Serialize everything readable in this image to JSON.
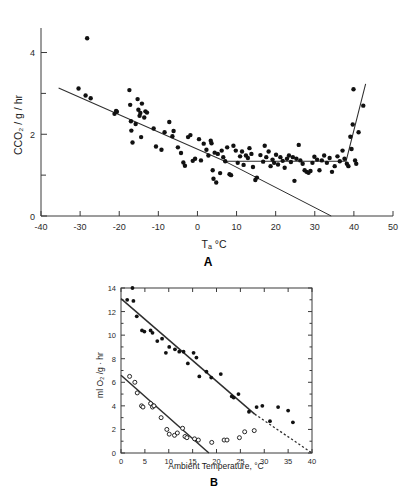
{
  "figure": {
    "background": "#ffffff",
    "ink_color": "#1a1a1a",
    "panel_a_label": "A",
    "panel_b_label": "B"
  },
  "chart_data": [
    {
      "id": "panel-a",
      "type": "scatter",
      "title": "",
      "panel_label": "A",
      "xlabel": "Tₐ °C",
      "ylabel": "CCO₂ / g / hr",
      "xlim": [
        -40,
        50
      ],
      "ylim": [
        0,
        4.6
      ],
      "grid": false,
      "legend": "none",
      "xticks": [
        -40,
        -30,
        -20,
        -10,
        0,
        10,
        20,
        30,
        40,
        50
      ],
      "xticklabels": [
        "-40",
        "-30",
        "-20",
        "-10",
        "0",
        "10",
        "20",
        "30",
        "40",
        "50"
      ],
      "yticks": [
        0,
        1,
        2,
        3,
        4
      ],
      "yticklabels": [
        "0",
        "",
        "2",
        "",
        "4"
      ],
      "y_minor_ticks": [
        1,
        3
      ],
      "series": [
        {
          "name": "CO2 production",
          "marker": "filled-circle",
          "color": "#111111",
          "points": [
            [
              -30.4,
              3.12
            ],
            [
              -28.2,
              4.35
            ],
            [
              -28.6,
              2.95
            ],
            [
              -27.3,
              2.88
            ],
            [
              -21.2,
              2.5
            ],
            [
              -20.8,
              2.57
            ],
            [
              -20.6,
              2.55
            ],
            [
              -17.4,
              3.08
            ],
            [
              -17.2,
              2.72
            ],
            [
              -17.0,
              2.32
            ],
            [
              -16.9,
              2.09
            ],
            [
              -16.6,
              1.8
            ],
            [
              -15.8,
              2.25
            ],
            [
              -15.3,
              2.86
            ],
            [
              -15.1,
              2.6
            ],
            [
              -14.8,
              2.45
            ],
            [
              -14.6,
              2.52
            ],
            [
              -14.4,
              1.93
            ],
            [
              -14.2,
              2.75
            ],
            [
              -13.6,
              2.41
            ],
            [
              -13.3,
              2.56
            ],
            [
              -12.9,
              2.53
            ],
            [
              -11.2,
              2.14
            ],
            [
              -10.6,
              1.7
            ],
            [
              -9.2,
              1.62
            ],
            [
              -8.4,
              2.05
            ],
            [
              -7.2,
              2.3
            ],
            [
              -6.4,
              1.95
            ],
            [
              -6.1,
              2.08
            ],
            [
              -5.0,
              1.68
            ],
            [
              -4.2,
              1.54
            ],
            [
              -3.6,
              1.31
            ],
            [
              -3.2,
              1.23
            ],
            [
              -2.4,
              1.93
            ],
            [
              -1.8,
              1.98
            ],
            [
              -1.2,
              1.35
            ],
            [
              -0.6,
              1.4
            ],
            [
              0.4,
              1.88
            ],
            [
              0.9,
              1.36
            ],
            [
              1.6,
              1.77
            ],
            [
              2.3,
              1.62
            ],
            [
              2.8,
              1.48
            ],
            [
              3.4,
              1.84
            ],
            [
              3.6,
              1.78
            ],
            [
              3.9,
              1.12
            ],
            [
              4.1,
              0.91
            ],
            [
              4.4,
              1.55
            ],
            [
              4.8,
              0.82
            ],
            [
              5.2,
              1.52
            ],
            [
              5.8,
              1.05
            ],
            [
              6.2,
              1.6
            ],
            [
              6.6,
              1.44
            ],
            [
              7.1,
              1.34
            ],
            [
              7.6,
              1.68
            ],
            [
              8.2,
              1.02
            ],
            [
              8.6,
              1.0
            ],
            [
              9.2,
              1.72
            ],
            [
              9.8,
              1.6
            ],
            [
              10.3,
              1.3
            ],
            [
              10.9,
              1.46
            ],
            [
              11.4,
              1.58
            ],
            [
              11.8,
              1.25
            ],
            [
              12.4,
              1.48
            ],
            [
              12.9,
              1.42
            ],
            [
              13.3,
              1.66
            ],
            [
              13.8,
              1.52
            ],
            [
              14.2,
              1.2
            ],
            [
              14.8,
              0.88
            ],
            [
              15.2,
              0.94
            ],
            [
              16.1,
              1.49
            ],
            [
              16.8,
              1.33
            ],
            [
              17.2,
              1.72
            ],
            [
              17.6,
              1.44
            ],
            [
              18.2,
              1.58
            ],
            [
              18.7,
              1.22
            ],
            [
              19.2,
              1.38
            ],
            [
              19.6,
              1.3
            ],
            [
              20.1,
              1.5
            ],
            [
              20.6,
              1.26
            ],
            [
              21.2,
              1.44
            ],
            [
              21.8,
              1.35
            ],
            [
              22.3,
              1.18
            ],
            [
              22.9,
              1.4
            ],
            [
              23.4,
              1.48
            ],
            [
              23.9,
              1.32
            ],
            [
              24.4,
              1.44
            ],
            [
              24.8,
              0.86
            ],
            [
              25.3,
              1.4
            ],
            [
              25.9,
              1.74
            ],
            [
              26.3,
              1.36
            ],
            [
              26.9,
              1.28
            ],
            [
              27.4,
              1.12
            ],
            [
              27.9,
              1.08
            ],
            [
              28.4,
              1.06
            ],
            [
              28.9,
              1.1
            ],
            [
              29.4,
              1.3
            ],
            [
              29.9,
              1.45
            ],
            [
              30.6,
              1.38
            ],
            [
              31.2,
              1.12
            ],
            [
              31.8,
              1.36
            ],
            [
              32.4,
              1.48
            ],
            [
              33.1,
              1.3
            ],
            [
              33.8,
              1.42
            ],
            [
              34.4,
              1.08
            ],
            [
              35.1,
              1.22
            ],
            [
              35.8,
              1.46
            ],
            [
              36.4,
              1.34
            ],
            [
              37.1,
              1.6
            ],
            [
              37.6,
              1.4
            ],
            [
              38.2,
              1.28
            ],
            [
              38.6,
              1.22
            ],
            [
              39.1,
              1.94
            ],
            [
              39.4,
              1.64
            ],
            [
              39.7,
              2.24
            ],
            [
              39.9,
              3.1
            ],
            [
              40.3,
              1.36
            ],
            [
              40.6,
              1.28
            ],
            [
              41.2,
              2.05
            ],
            [
              42.4,
              2.7
            ]
          ]
        }
      ],
      "fit_curve": {
        "style": "solid",
        "description": "piecewise linear fit: descending, plateau, steep rise",
        "vertices": [
          [
            -35.5,
            3.13
          ],
          [
            7.0,
            1.34
          ],
          [
            38.0,
            1.34
          ],
          [
            43.0,
            3.23
          ]
        ]
      },
      "extension_line": {
        "style": "solid",
        "description": "extrapolation of descending limb to zero",
        "vertices": [
          [
            7.0,
            1.34
          ],
          [
            34.2,
            0.0
          ]
        ]
      }
    },
    {
      "id": "panel-b",
      "type": "scatter",
      "title": "",
      "panel_label": "B",
      "xlabel": "Ambient  Temperature,  °C",
      "ylabel": "ml O₂ /g · hr",
      "xlim": [
        0,
        40
      ],
      "ylim": [
        0,
        14
      ],
      "grid": false,
      "legend": "none",
      "xticks": [
        0,
        5,
        10,
        15,
        20,
        25,
        30,
        35,
        40
      ],
      "xticklabels": [
        "0",
        "5",
        "10",
        "15",
        "20",
        "25",
        "30",
        "35",
        "40"
      ],
      "yticks": [
        0,
        2,
        4,
        6,
        8,
        10,
        12,
        14
      ],
      "yticklabels": [
        "0",
        "2",
        "4",
        "6",
        "8",
        "10",
        "12",
        "14"
      ],
      "series": [
        {
          "name": "filled-circle series",
          "marker": "filled-circle",
          "color": "#111111",
          "points": [
            [
              1.3,
              13.0
            ],
            [
              2.4,
              14.0
            ],
            [
              2.6,
              12.9
            ],
            [
              3.3,
              11.6
            ],
            [
              4.4,
              10.4
            ],
            [
              4.9,
              10.3
            ],
            [
              6.2,
              10.4
            ],
            [
              6.6,
              10.2
            ],
            [
              7.6,
              9.5
            ],
            [
              8.6,
              9.7
            ],
            [
              9.4,
              8.5
            ],
            [
              10.1,
              9.0
            ],
            [
              11.3,
              8.8
            ],
            [
              12.2,
              8.6
            ],
            [
              13.1,
              8.6
            ],
            [
              14.0,
              7.6
            ],
            [
              15.2,
              8.5
            ],
            [
              15.8,
              8.1
            ],
            [
              16.4,
              6.5
            ],
            [
              17.9,
              6.9
            ],
            [
              18.9,
              6.4
            ],
            [
              20.9,
              6.7
            ],
            [
              23.2,
              4.8
            ],
            [
              23.6,
              4.7
            ],
            [
              24.6,
              5.0
            ],
            [
              26.8,
              3.5
            ],
            [
              28.4,
              3.9
            ],
            [
              29.6,
              4.0
            ],
            [
              31.2,
              2.7
            ],
            [
              32.9,
              3.9
            ],
            [
              35.0,
              3.6
            ],
            [
              36.0,
              2.6
            ]
          ]
        },
        {
          "name": "open-circle series",
          "marker": "open-circle",
          "color": "#111111",
          "points": [
            [
              1.8,
              6.5
            ],
            [
              2.9,
              6.0
            ],
            [
              3.4,
              5.1
            ],
            [
              4.3,
              4.0
            ],
            [
              4.6,
              3.9
            ],
            [
              6.2,
              4.2
            ],
            [
              6.6,
              3.9
            ],
            [
              6.9,
              4.0
            ],
            [
              8.4,
              3.0
            ],
            [
              9.6,
              2.0
            ],
            [
              10.1,
              1.6
            ],
            [
              11.2,
              1.5
            ],
            [
              11.8,
              1.7
            ],
            [
              12.9,
              2.1
            ],
            [
              13.4,
              1.4
            ],
            [
              13.8,
              1.3
            ],
            [
              15.4,
              1.2
            ],
            [
              16.2,
              1.1
            ],
            [
              19.0,
              0.9
            ],
            [
              21.6,
              1.1
            ],
            [
              22.2,
              1.1
            ],
            [
              24.8,
              1.3
            ],
            [
              25.9,
              1.8
            ],
            [
              27.9,
              1.9
            ]
          ]
        }
      ],
      "fit_lines": [
        {
          "name": "upper-regression",
          "style": "solid",
          "vertices": [
            [
              0.0,
              13.1
            ],
            [
              28.0,
              3.3
            ]
          ]
        },
        {
          "name": "upper-regression-extension",
          "style": "dashed",
          "vertices": [
            [
              28.0,
              3.3
            ],
            [
              40.0,
              0.0
            ]
          ]
        },
        {
          "name": "lower-regression",
          "style": "solid",
          "vertices": [
            [
              0.0,
              6.6
            ],
            [
              18.4,
              0.0
            ]
          ]
        }
      ]
    }
  ]
}
